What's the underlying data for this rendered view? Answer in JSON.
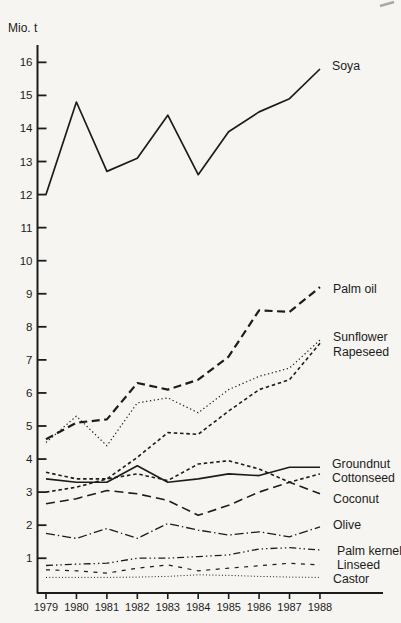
{
  "page": {
    "background_color": "#f6f5f2",
    "ink_color": "#1c1c1c"
  },
  "chart_data": {
    "type": "line",
    "title": "",
    "unit_label": "Mio. t",
    "x_categories": [
      "1979",
      "1980",
      "1981",
      "1982",
      "1983",
      "1984",
      "1985",
      "1986",
      "1987",
      "1988"
    ],
    "y_axis": {
      "min": 0,
      "max": 16,
      "tick_step": 1
    },
    "grid": false,
    "legend_position": "labels-at-line-ends-right",
    "series": [
      {
        "name": "Soya",
        "line_style": "solid",
        "width": 1.7,
        "values": [
          12.0,
          14.8,
          12.7,
          13.1,
          14.4,
          12.6,
          13.9,
          14.5,
          14.9,
          15.8
        ],
        "label": {
          "x": 332,
          "y": 66
        }
      },
      {
        "name": "Palm oil",
        "line_style": "bold-dash",
        "width": 2.2,
        "values": [
          4.6,
          5.1,
          5.2,
          6.3,
          6.1,
          6.4,
          7.1,
          8.5,
          8.45,
          9.2
        ],
        "label": {
          "x": 333,
          "y": 289
        }
      },
      {
        "name": "Sunflower",
        "line_style": "dotted",
        "width": 1.2,
        "values": [
          4.5,
          5.3,
          4.4,
          5.7,
          5.85,
          5.4,
          6.1,
          6.5,
          6.75,
          7.6
        ],
        "label": {
          "x": 333,
          "y": 337
        }
      },
      {
        "name": "Rapeseed",
        "line_style": "short-dash",
        "width": 1.6,
        "values": [
          3.0,
          3.15,
          3.4,
          4.05,
          4.8,
          4.75,
          5.45,
          6.1,
          6.4,
          7.5
        ],
        "label": {
          "x": 333,
          "y": 352
        }
      },
      {
        "name": "Groundnut",
        "line_style": "solid",
        "width": 1.6,
        "values": [
          3.4,
          3.3,
          3.3,
          3.8,
          3.3,
          3.4,
          3.55,
          3.5,
          3.75,
          3.75
        ],
        "label": {
          "x": 332,
          "y": 464
        }
      },
      {
        "name": "Cottonseed",
        "line_style": "short-dash",
        "width": 1.6,
        "values": [
          3.6,
          3.4,
          3.4,
          3.55,
          3.35,
          3.85,
          3.95,
          3.7,
          3.3,
          3.55
        ],
        "label": {
          "x": 332,
          "y": 478
        }
      },
      {
        "name": "Coconut",
        "line_style": "long-dash",
        "width": 1.6,
        "values": [
          2.65,
          2.8,
          3.05,
          2.95,
          2.75,
          2.3,
          2.6,
          3.0,
          3.3,
          2.95
        ],
        "label": {
          "x": 333,
          "y": 499
        }
      },
      {
        "name": "Olive",
        "line_style": "dash-dot",
        "width": 1.3,
        "values": [
          1.75,
          1.6,
          1.9,
          1.6,
          2.05,
          1.85,
          1.7,
          1.8,
          1.65,
          1.95
        ],
        "label": {
          "x": 333,
          "y": 525
        }
      },
      {
        "name": "Palm kernel",
        "line_style": "dash-dot-dot",
        "width": 1.3,
        "values": [
          0.78,
          0.82,
          0.85,
          1.0,
          1.0,
          1.05,
          1.1,
          1.28,
          1.32,
          1.25
        ],
        "label": {
          "x": 337,
          "y": 551
        }
      },
      {
        "name": "Linseed",
        "line_style": "sparse-dash",
        "width": 1.2,
        "values": [
          0.65,
          0.62,
          0.55,
          0.7,
          0.8,
          0.62,
          0.7,
          0.77,
          0.85,
          0.8
        ],
        "label": {
          "x": 337,
          "y": 565
        }
      },
      {
        "name": "Castor",
        "line_style": "fine-dot",
        "width": 1.0,
        "values": [
          0.42,
          0.42,
          0.42,
          0.43,
          0.45,
          0.5,
          0.48,
          0.45,
          0.43,
          0.42
        ],
        "label": {
          "x": 333,
          "y": 579
        }
      }
    ]
  }
}
